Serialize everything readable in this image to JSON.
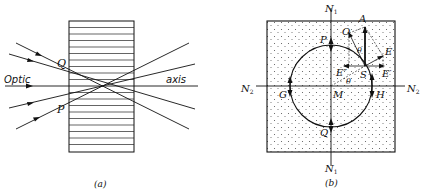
{
  "figure_a": {
    "caption": "(a)",
    "label_left": "Optic",
    "label_right": "axis",
    "point_q": "Q",
    "point_p": "P"
  },
  "figure_b": {
    "caption": "(b)",
    "n1_top": "N",
    "n1_top_sub": "1",
    "n1_bottom": "N",
    "n1_bottom_sub": "1",
    "n2_left": "N",
    "n2_left_sub": "2",
    "n2_right": "N",
    "n2_right_sub": "2",
    "point_a": "A",
    "point_o": "O",
    "point_e": "E",
    "point_e_prime": "E′",
    "point_e_dblprime": "E″",
    "point_s": "S",
    "point_p": "P",
    "point_q": "Q",
    "point_g": "G",
    "point_h": "H",
    "point_m": "M",
    "angle_theta_1": "θ",
    "angle_theta_2": "θ"
  },
  "colors": {
    "ink": "#111111",
    "background": "#ffffff",
    "stipple": "#555555"
  }
}
